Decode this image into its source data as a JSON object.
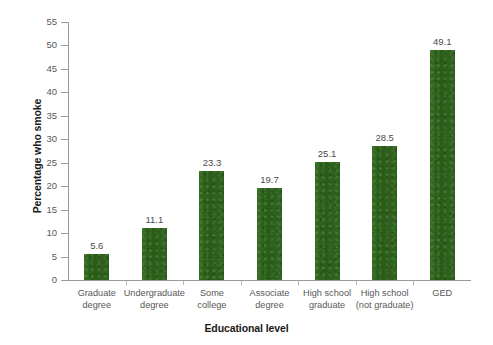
{
  "chart_data": {
    "type": "bar",
    "title": "",
    "subtitle": "",
    "xlabel": "Educational level",
    "ylabel": "Percentage who smoke",
    "categories": [
      "Graduate degree",
      "Undergraduate degree",
      "Some college",
      "Associate degree",
      "High school graduate",
      "High school (not graduate)",
      "GED"
    ],
    "category_lines": [
      [
        "Graduate",
        "degree"
      ],
      [
        "Undergraduate",
        "degree"
      ],
      [
        "Some",
        "college"
      ],
      [
        "Associate",
        "degree"
      ],
      [
        "High school",
        "graduate"
      ],
      [
        "High school",
        "(not graduate)"
      ],
      [
        "GED"
      ]
    ],
    "values": [
      5.6,
      11.1,
      23.3,
      19.7,
      25.1,
      28.5,
      49.1
    ],
    "value_labels": [
      "5.6",
      "11.1",
      "23.3",
      "19.7",
      "25.1",
      "28.5",
      "49.1"
    ],
    "ylim": [
      0,
      55
    ],
    "ytick_values": [
      0,
      5,
      10,
      15,
      20,
      25,
      30,
      35,
      40,
      45,
      50,
      55
    ],
    "ytick_labels": [
      "0",
      "5",
      "10",
      "15",
      "20",
      "25",
      "30",
      "35",
      "40",
      "45",
      "50",
      "55"
    ],
    "grid": false,
    "legend": false,
    "legend_position": "none",
    "bar_color": "#2b5e1a",
    "axis_color": "#9a9a9a",
    "tick_label_color": "#58585a",
    "axis_title_color": "#1a1a1a"
  }
}
